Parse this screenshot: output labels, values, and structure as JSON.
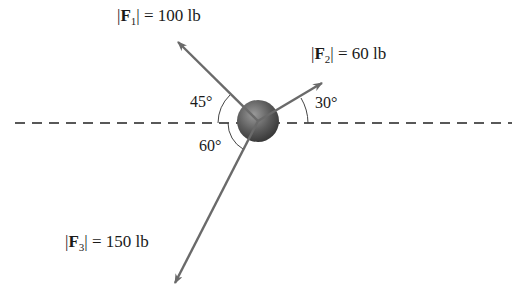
{
  "diagram": {
    "type": "force-diagram",
    "forces": [
      {
        "id": "F1",
        "symbol": "F",
        "subscript": "1",
        "magnitude": "100 lb",
        "angle_label": "45°",
        "direction": "up-left"
      },
      {
        "id": "F2",
        "symbol": "F",
        "subscript": "2",
        "magnitude": "60 lb",
        "angle_label": "30°",
        "direction": "up-right"
      },
      {
        "id": "F3",
        "symbol": "F",
        "subscript": "3",
        "magnitude": "150 lb",
        "angle_label": "60°",
        "direction": "down-left"
      }
    ],
    "reference_line": "horizontal dashed",
    "colors": {
      "arrow": "#6a6a6a",
      "ball": "#5a5a5a",
      "text": "#1a1a1a"
    }
  }
}
